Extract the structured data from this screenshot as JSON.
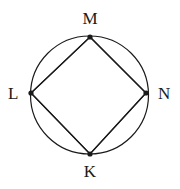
{
  "figure": {
    "kind": "circle-with-inscribed-quadrilateral",
    "background_color": "#ffffff",
    "stroke_color": "#1a1a1a",
    "label_color": "#1a1a1a",
    "circle": {
      "center_x": 89.5,
      "center_y": 95,
      "radius": 59,
      "stroke_width": 1.2
    },
    "vertices": [
      {
        "id": "M",
        "label": "M",
        "x": 90,
        "y": 37,
        "position": "top",
        "dot_radius": 2.6
      },
      {
        "id": "N",
        "label": "N",
        "x": 146,
        "y": 93,
        "position": "right",
        "dot_radius": 2.6
      },
      {
        "id": "K",
        "label": "K",
        "x": 90,
        "y": 154,
        "position": "bottom",
        "dot_radius": 2.6
      },
      {
        "id": "L",
        "label": "L",
        "x": 31,
        "y": 93,
        "position": "left",
        "dot_radius": 2.6
      }
    ],
    "edges": [
      {
        "id": "LM",
        "from": "L",
        "to": "M"
      },
      {
        "id": "MN",
        "from": "M",
        "to": "N"
      },
      {
        "id": "NK",
        "from": "N",
        "to": "K"
      },
      {
        "id": "KL",
        "from": "K",
        "to": "L"
      }
    ],
    "labels": {
      "top": "M",
      "right": "N",
      "bottom": "K",
      "left": "L"
    }
  }
}
